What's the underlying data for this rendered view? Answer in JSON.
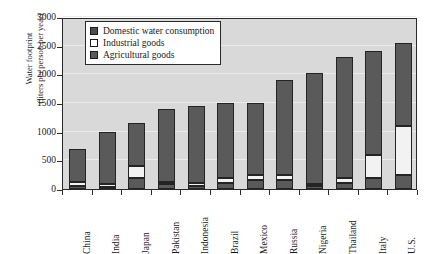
{
  "chart_data": {
    "type": "bar",
    "stacked": true,
    "title": "",
    "xlabel": "",
    "ylabel": "Water footprint (liters per person per year)",
    "ylabel_line1": "Water footprint",
    "ylabel_line2": "(liters per person per year)",
    "ylim": [
      0,
      3000
    ],
    "ytick_step": 500,
    "yticks": [
      0,
      500,
      1000,
      1500,
      2000,
      2500,
      3000
    ],
    "ytick_labels": [
      "0",
      "500",
      "1000",
      "1500",
      "2000",
      "2500",
      "3000"
    ],
    "grid": true,
    "legend_position": "top-left-inside",
    "categories": [
      "China",
      "India",
      "Japan",
      "Pakistan",
      "Indonesia",
      "Brazil",
      "Mexico",
      "Russia",
      "Nigeria",
      "Thailand",
      "Italy",
      "U.S."
    ],
    "series": [
      {
        "name": "Agricultural goods",
        "color": "#5a5a5a",
        "values": [
          60,
          40,
          200,
          80,
          60,
          100,
          150,
          150,
          60,
          100,
          200,
          250
        ]
      },
      {
        "name": "Industrial goods",
        "color": "#f2f2f2",
        "values": [
          70,
          40,
          200,
          40,
          50,
          100,
          100,
          100,
          20,
          90,
          400,
          850
        ]
      },
      {
        "name": "Domestic water consumption",
        "color": "#5a5a5a",
        "values": [
          570,
          920,
          750,
          1280,
          1340,
          1300,
          1250,
          1650,
          1940,
          2110,
          1800,
          1450
        ]
      }
    ],
    "totals": [
      700,
      1000,
      1150,
      1400,
      1450,
      1500,
      1500,
      1900,
      2020,
      2300,
      2400,
      2550
    ],
    "legend_entries": [
      {
        "label": "Domestic water consumption",
        "swatch": "dark"
      },
      {
        "label": "Industrial goods",
        "swatch": "light"
      },
      {
        "label": "Agricultural goods",
        "swatch": "dark2"
      }
    ]
  },
  "colors": {
    "plot_background": "#d9d9d9",
    "bar_dark": "#5a5a5a",
    "bar_light": "#f2f2f2",
    "axis": "#2a2a2a",
    "gridline": "#ececec"
  }
}
